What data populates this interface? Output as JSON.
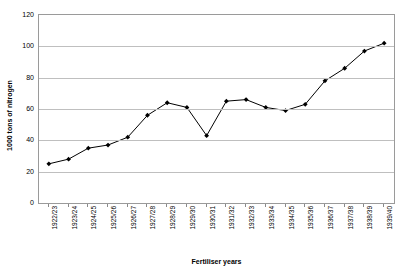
{
  "chart_data": {
    "type": "line",
    "title": "",
    "subtitle": "",
    "xlabel": "Fertiliser years",
    "ylabel": "1000 tons of nitrogen",
    "ylim": [
      0,
      120
    ],
    "ytick_step": 20,
    "yticks": [
      "0",
      "20",
      "40",
      "60",
      "80",
      "100",
      "120"
    ],
    "grid": true,
    "legend": false,
    "legend_position": "none",
    "marker": "diamond",
    "line_color": "#000000",
    "marker_color": "#000000",
    "grid_color": "#bfbfbf",
    "border_color": "#9a9a9a",
    "background": "#ffffff",
    "categories": [
      "1922/23",
      "1923/24",
      "1924/25",
      "1925/26",
      "1926/27",
      "1927/28",
      "1928/29",
      "1929/30",
      "1930/31",
      "1931/32",
      "1932/33",
      "1933/34",
      "1934/35",
      "1935/36",
      "1936/37",
      "1937/38",
      "1938/39",
      "1939/40"
    ],
    "values": [
      25,
      28,
      35,
      37,
      42,
      56,
      64,
      61,
      43,
      65,
      66,
      61,
      59,
      63,
      78,
      86,
      97,
      102
    ]
  }
}
